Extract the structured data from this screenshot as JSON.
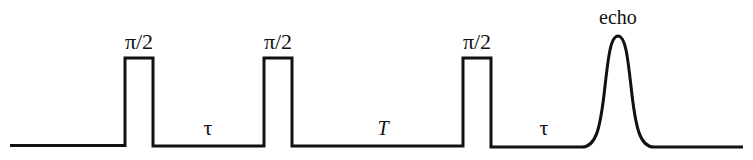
{
  "diagram": {
    "type": "pulse-sequence",
    "pulses": [
      {
        "label": "π/2",
        "x_start": 125,
        "x_end": 153
      },
      {
        "label": "π/2",
        "x_start": 264,
        "x_end": 292
      },
      {
        "label": "π/2",
        "x_start": 463,
        "x_end": 491
      }
    ],
    "intervals": [
      {
        "label": "τ",
        "x": 208
      },
      {
        "label": "T",
        "x": 383
      },
      {
        "label": "τ",
        "x": 544
      }
    ],
    "echo": {
      "label": "echo",
      "x": 618
    },
    "baseline_y": 146,
    "pulse_top_y": 58,
    "echo_peak_y": 36,
    "line_color": "#111111"
  }
}
